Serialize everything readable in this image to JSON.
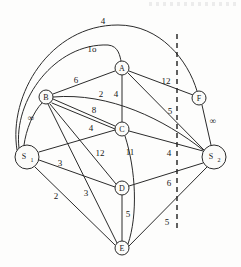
{
  "figure": {
    "type": "weighted-network-flow-graph",
    "background_color": "#fdfdfc",
    "ink_color": "#2b2b2b"
  },
  "nodes": [
    {
      "id": "S1",
      "label": "S",
      "sub": "1",
      "x": 27,
      "y": 157,
      "r": 12
    },
    {
      "id": "B",
      "label": "B",
      "sub": "",
      "x": 46,
      "y": 97,
      "r": 7
    },
    {
      "id": "A",
      "label": "A",
      "sub": "",
      "x": 122,
      "y": 68,
      "r": 7
    },
    {
      "id": "C",
      "label": "C",
      "sub": "",
      "x": 122,
      "y": 129,
      "r": 7
    },
    {
      "id": "D",
      "label": "D",
      "sub": "",
      "x": 122,
      "y": 188,
      "r": 7
    },
    {
      "id": "E",
      "label": "E",
      "sub": "",
      "x": 122,
      "y": 248,
      "r": 7
    },
    {
      "id": "F",
      "label": "F",
      "sub": "",
      "x": 199,
      "y": 98,
      "r": 7
    },
    {
      "id": "S2",
      "label": "S",
      "sub": "2",
      "x": 214,
      "y": 157,
      "r": 12
    }
  ],
  "edges": [
    {
      "from": "S1",
      "to": "F",
      "weight": "4",
      "label_x": 103,
      "label_y": 21,
      "curve": "outer-top"
    },
    {
      "from": "S1",
      "to": "A",
      "weight": "1o",
      "label_x": 92,
      "label_y": 49,
      "curve": "inner-top"
    },
    {
      "from": "B",
      "to": "A",
      "weight": "6",
      "label_x": 76,
      "label_y": 80
    },
    {
      "from": "B",
      "to": "S2",
      "weight": "2",
      "label_x": 101,
      "label_y": 94,
      "curve": "slight"
    },
    {
      "from": "A",
      "to": "C",
      "weight": "4",
      "label_x": 116,
      "label_y": 94
    },
    {
      "from": "A",
      "to": "F",
      "weight": "12",
      "label_x": 166,
      "label_y": 81
    },
    {
      "from": "A",
      "to": "S2",
      "weight": "5",
      "label_x": 170,
      "label_y": 111
    },
    {
      "from": "B",
      "to": "C",
      "weight": "8",
      "label_x": 94,
      "label_y": 110
    },
    {
      "from": "B",
      "to": "C2",
      "weight": "4",
      "label_x": 91,
      "label_y": 128
    },
    {
      "from": "S1",
      "to": "B",
      "weight": "∞",
      "label_x": 31,
      "label_y": 118
    },
    {
      "from": "F",
      "to": "S2",
      "weight": "∞",
      "label_x": 213,
      "label_y": 121
    },
    {
      "from": "B",
      "to": "D",
      "weight": "12",
      "label_x": 100,
      "label_y": 153
    },
    {
      "from": "C",
      "to": "E",
      "weight": "11",
      "label_x": 130,
      "label_y": 152
    },
    {
      "from": "C",
      "to": "S2",
      "weight": "4",
      "label_x": 169,
      "label_y": 153
    },
    {
      "from": "S1",
      "to": "D",
      "weight": "3",
      "label_x": 60,
      "label_y": 163
    },
    {
      "from": "S1",
      "to": "E",
      "weight": "2",
      "label_x": 56,
      "label_y": 196
    },
    {
      "from": "B",
      "to": "E",
      "weight": "3",
      "label_x": 86,
      "label_y": 193
    },
    {
      "from": "D",
      "to": "S2",
      "weight": "6",
      "label_x": 169,
      "label_y": 183
    },
    {
      "from": "D",
      "to": "E",
      "weight": "5",
      "label_x": 128,
      "label_y": 214
    },
    {
      "from": "E",
      "to": "S2",
      "weight": "5",
      "label_x": 167,
      "label_y": 222
    }
  ],
  "weights_list": [
    "4",
    "1o",
    "6",
    "2",
    "4",
    "12",
    "5",
    "8",
    "4",
    "∞",
    "∞",
    "12",
    "11",
    "4",
    "3",
    "2",
    "3",
    "6",
    "5",
    "5"
  ],
  "cut": {
    "name": "cut-line",
    "style": "dashed-vertical",
    "x": 177,
    "y_top": 34,
    "y_bottom": 231
  }
}
